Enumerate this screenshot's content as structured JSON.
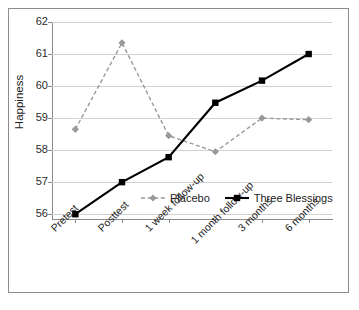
{
  "chart_data": {
    "type": "line",
    "title": "",
    "xlabel": "",
    "ylabel": "Happiness",
    "categories": [
      "Pretest",
      "Posttest",
      "1 week follow-up",
      "1 month follow-up",
      "3 months",
      "6 months"
    ],
    "yticks": [
      56,
      57,
      58,
      59,
      60,
      61,
      62
    ],
    "ytick_labels": [
      "56",
      "57",
      "58",
      "59",
      "60",
      "61",
      "62"
    ],
    "ylim": [
      55.85,
      62.0
    ],
    "grid": "horizontal",
    "legend_position": "inside lower-right",
    "series": [
      {
        "name": "Placebo",
        "color": "#999999",
        "linestyle": "dashed",
        "marker": "diamond",
        "values": [
          58.65,
          61.35,
          58.45,
          57.95,
          59.0,
          58.95
        ]
      },
      {
        "name": "Three Blessings",
        "color": "#000000",
        "linestyle": "solid",
        "marker": "square",
        "values": [
          56.0,
          57.0,
          57.78,
          59.48,
          60.17,
          61.0
        ]
      }
    ]
  },
  "axes": {
    "y_title": "Happiness"
  },
  "legend": {
    "items": [
      {
        "label": "Placebo"
      },
      {
        "label": "Three Blessings"
      }
    ]
  },
  "colors": {
    "placebo": "#999999",
    "three_blessings": "#000000",
    "gridline": "#d2d2d2",
    "axis": "#8a8a8a",
    "frame": "#8d8d8d"
  }
}
